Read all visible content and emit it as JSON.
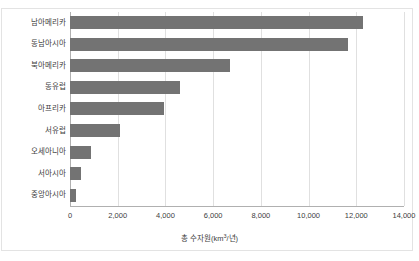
{
  "chart_data": {
    "type": "bar",
    "orientation": "horizontal",
    "title": "",
    "xlabel": "총 수자원(km³/년)",
    "xlabel_parts": {
      "prefix": "총 수자원(km",
      "sup": "3",
      "suffix": "/년)"
    },
    "ylabel": "",
    "categories": [
      "남아메리카",
      "동남아시아",
      "북아메리카",
      "동유럽",
      "아프리카",
      "서유럽",
      "오세아니아",
      "서아시아",
      "중앙아시아"
    ],
    "values": [
      12300,
      11650,
      6700,
      4600,
      3950,
      2100,
      900,
      450,
      250
    ],
    "xlim": [
      0,
      14000
    ],
    "xticks": [
      0,
      2000,
      4000,
      6000,
      8000,
      10000,
      12000,
      14000
    ],
    "xtick_labels": [
      "0",
      "2,000",
      "4,000",
      "6,000",
      "8,000",
      "10,000",
      "12,000",
      "14,000"
    ],
    "grid": true,
    "legend": false,
    "bar_color": "#737373",
    "grid_color": "#e0e0e0",
    "axis_color": "#b0b0b0",
    "text_color": "#404040",
    "background": "#ffffff"
  }
}
